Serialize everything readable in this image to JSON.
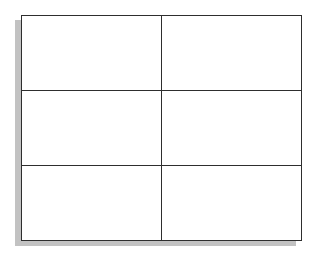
{
  "table": {
    "column_count": 2,
    "row_count": 3,
    "rows": [
      [
        "",
        ""
      ],
      [
        "",
        ""
      ],
      [
        "",
        ""
      ]
    ]
  },
  "colors": {
    "background": "#ffffff",
    "cell_background": "#ffffff",
    "border": "#2e2e2e",
    "shadow": "#c2c2c2"
  }
}
